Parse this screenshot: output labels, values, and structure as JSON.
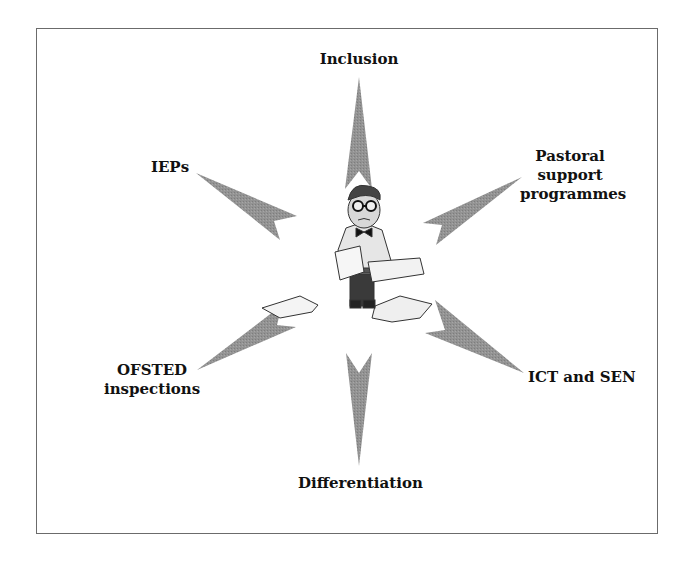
{
  "diagram": {
    "center": {
      "figure": "cartoon-man-with-papers"
    },
    "arrow_color": "#8f8f8f",
    "frame_color": "#6b6b6b",
    "nodes": [
      {
        "id": "inclusion",
        "lines": [
          "Inclusion"
        ]
      },
      {
        "id": "ieps",
        "lines": [
          "IEPs"
        ]
      },
      {
        "id": "pastoral",
        "lines": [
          "Pastoral",
          "support",
          "programmes"
        ]
      },
      {
        "id": "ofsted",
        "lines": [
          "OFSTED",
          "inspections"
        ]
      },
      {
        "id": "ict",
        "lines": [
          "ICT and SEN"
        ]
      },
      {
        "id": "differentiation",
        "lines": [
          "Differentiation"
        ]
      }
    ]
  }
}
